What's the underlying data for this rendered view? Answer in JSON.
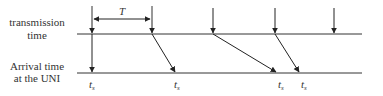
{
  "diagram": {
    "type": "timing-diagram",
    "labels": {
      "top_axis_line1": "transmission",
      "top_axis_line2": "time",
      "bottom_axis_line1": "Arrival time",
      "bottom_axis_line2": "at the UNI"
    },
    "period_label": "T",
    "arrival_labels": [
      {
        "main": "t",
        "sub": "s"
      },
      {
        "main": "t",
        "sub": "s"
      },
      {
        "main": "t",
        "sub": "s"
      },
      {
        "main": "t",
        "sub": "s"
      }
    ],
    "transmissions": [
      {
        "x_tx": 92,
        "x_arrival": 92
      },
      {
        "x_tx": 152,
        "x_arrival": 176
      },
      {
        "x_tx": 213,
        "x_arrival": 277
      },
      {
        "x_tx": 275,
        "x_arrival": 300
      },
      {
        "x_tx": 335,
        "x_arrival": null
      }
    ],
    "colors": {
      "line": "#333333",
      "text": "#333333"
    }
  }
}
